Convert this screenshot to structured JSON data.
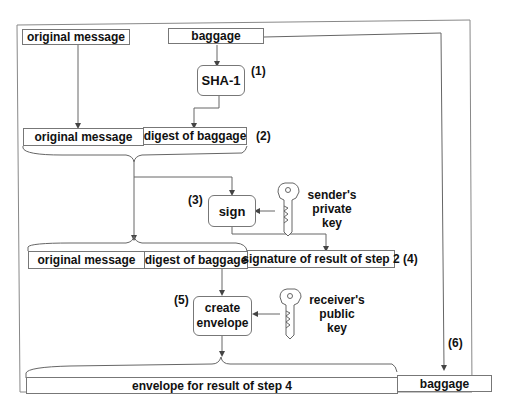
{
  "diagram": {
    "type": "flowchart",
    "title": "",
    "top_row": {
      "original_message": "original message",
      "baggage": "baggage"
    },
    "steps": [
      {
        "number": "(1)",
        "process": "SHA-1"
      },
      {
        "number": "(2)",
        "result_fields": [
          "original message",
          "digest of baggage"
        ]
      },
      {
        "number": "(3)",
        "process": "sign",
        "key_label": [
          "sender's",
          "private",
          "key"
        ]
      },
      {
        "number": "(4)",
        "result_fields": [
          "original message",
          "digest of baggage",
          "signature of result of step 2"
        ]
      },
      {
        "number": "(5)",
        "process": [
          "create",
          "envelope"
        ],
        "key_label": [
          "receiver's",
          "public",
          "key"
        ]
      },
      {
        "number": "(6)",
        "result_fields": [
          "envelope for result of step 4",
          "baggage"
        ]
      }
    ],
    "icons": [
      "key-icon",
      "key-icon"
    ],
    "colors": {
      "line": "#555555",
      "border": "#777777",
      "text": "#111111"
    }
  }
}
